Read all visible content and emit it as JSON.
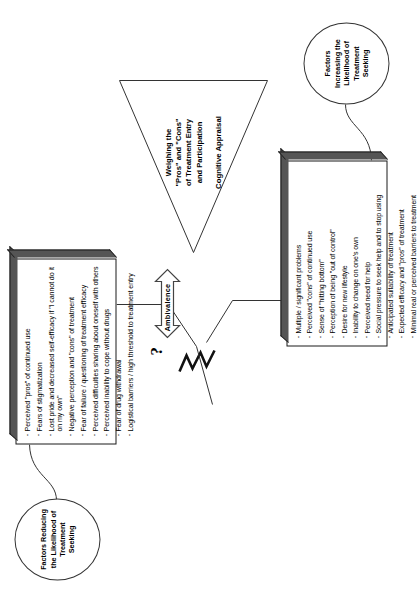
{
  "diagram": {
    "orientation": "rotated-90",
    "colors": {
      "stroke": "#1a1a1a",
      "box_fill": "#ffffff",
      "box_shade": "#555555",
      "background": "#ffffff"
    }
  },
  "reducing": {
    "callout_label": "Factors Reducing the Likelihood of Treatment Seeking",
    "bullets": [
      "Perceived \"pros\" of continued use",
      "Fears of stigmatization",
      "Lost pride and decreased self-efficacy if \"I cannot do it on my own\"",
      "Negative perception and \"cons\" of treatment",
      "Fear of failure / questioning of treatment efficacy",
      "Perceived difficulties sharing about oneself with others",
      "Perceived inability to cope without drugs",
      "Fear of drug withdrawal",
      "Logistical barriers / high threshold to treatment entry"
    ]
  },
  "increasing": {
    "callout_label": "Factors Increasing the Likelihood of Treatment Seeking",
    "bullets": [
      "Multiple / significant problems",
      "Perceived \"cons\" of continued use",
      "Sense of \"hitting bottom\"",
      "Perception of being \"out of control\"",
      "Desire for new lifestyle",
      "Inability to change on one's own",
      "Perceived need for help",
      "Social pressure to seek help and to stop using",
      "Anticipated suitability of treatment",
      "Expected efficacy and \"pros\" of treatment",
      "Minimal real or perceived barriers to treatment"
    ]
  },
  "center": {
    "triangle_text": "Weighing the \"Pros\" and \"Cons\" of Treatment Entry and Participation",
    "triangle_lines": [
      "Weighing the",
      "\"Pros\" and \"Cons\"",
      "of Treatment Entry",
      "and Participation"
    ],
    "appraisal_label": "Cognitive Appraisal",
    "ambivalence_label": "Ambivalence",
    "question_mark": "?"
  }
}
